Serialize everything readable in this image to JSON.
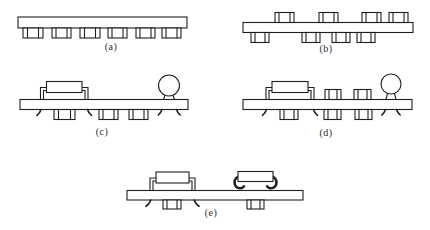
{
  "colors": {
    "ink": "#1f1f1f",
    "paper": "#ffffff"
  },
  "panels": {
    "a": {
      "label": "(a)",
      "parts": [
        "circuit-board",
        "smt-chips-bottom-x6"
      ]
    },
    "b": {
      "label": "(b)",
      "parts": [
        "circuit-board",
        "smt-chips-top-x4",
        "smt-chips-bottom-x4"
      ]
    },
    "c": {
      "label": "(c)",
      "parts": [
        "circuit-board",
        "through-hole-dip",
        "radial-component",
        "smt-chips-bottom-x3"
      ]
    },
    "d": {
      "label": "(d)",
      "parts": [
        "circuit-board",
        "through-hole-dip",
        "smt-chips-top-x2",
        "radial-component",
        "smt-chips-bottom-x3"
      ]
    },
    "e": {
      "label": "(e)",
      "parts": [
        "circuit-board",
        "through-hole-dip",
        "j-lead-component",
        "smt-chips-bottom-x2"
      ]
    }
  }
}
